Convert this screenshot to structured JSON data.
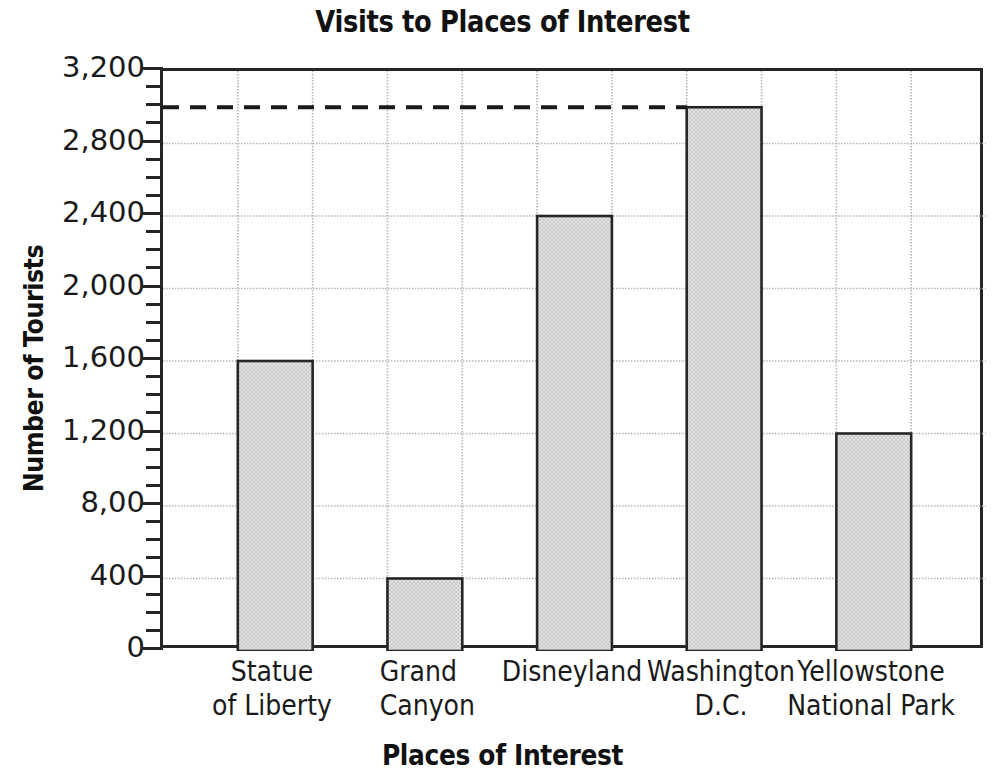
{
  "chart_data": {
    "type": "bar",
    "title": "Visits to Places of Interest",
    "xlabel": "Places of Interest",
    "ylabel": "Number of Tourists",
    "categories": [
      "Statue of Liberty",
      "Grand Canyon",
      "Disneyland",
      "Washington D.C.",
      "Yellowstone National Park"
    ],
    "values": [
      1600,
      400,
      2400,
      3000,
      1200
    ],
    "ylim": [
      0,
      3200
    ],
    "ytick_values": [
      0,
      400,
      800,
      1200,
      1600,
      2000,
      2400,
      2800,
      3200
    ],
    "ytick_labels": [
      "0",
      "400",
      "8,00",
      "1,200",
      "1,600",
      "2,000",
      "2,400",
      "2,800",
      "3,200"
    ],
    "ytick_minor_step": 100,
    "grid": true,
    "legend": "none",
    "annotations": [
      {
        "name": "reference-dashed-line",
        "value": 3000,
        "style": "dashed",
        "from_category": null,
        "to_category": "Washington D.C."
      }
    ],
    "bar_fill_color": "#d9d9d9",
    "bar_edge_color": "#262626",
    "grid_color": "#b5b5b5",
    "axis_color": "#262626"
  },
  "labels": {
    "x_tick_lines": [
      {
        "line1": "Statue",
        "line2": "of Liberty"
      },
      {
        "line1": "Grand",
        "line2": "Canyon"
      },
      {
        "line1": "Disneyland",
        "line2": ""
      },
      {
        "line1": "Washington",
        "line2": "D.C."
      },
      {
        "line1": "Yellowstone",
        "line2": "National Park"
      }
    ]
  }
}
